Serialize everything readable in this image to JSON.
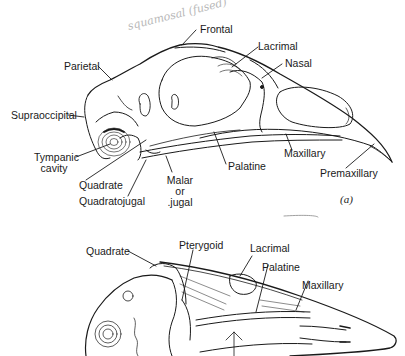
{
  "figure": {
    "panel_a": {
      "panel_label": "(a)",
      "title": "Bird skull, lateral view",
      "labels": {
        "frontal": "Frontal",
        "lacrimal": "Lacrimal",
        "nasal": "Nasal",
        "parietal": "Parietal",
        "supraoccipital": "Supraoccipital",
        "tympanic_cavity_1": "Tympanic",
        "tympanic_cavity_2": "cavity",
        "quadrate": "Quadrate",
        "quadratojugal": "Quadratojugal",
        "malar_1": "Malar",
        "malar_2": "or",
        "malar_3": ".jugal",
        "palatine": "Palatine",
        "maxillary": "Maxillary",
        "premaxillary": "Premaxillary"
      },
      "handwritten": {
        "squamosal_note": "squamosal (fused)"
      }
    },
    "panel_b": {
      "title": "Bird skull, ventral view",
      "labels": {
        "quadrate": "Quadrate",
        "pterygoid": "Pterygoid",
        "lacrimal": "Lacrimal",
        "palatine": "Palatine",
        "maxillary": "Maxillary"
      }
    }
  }
}
